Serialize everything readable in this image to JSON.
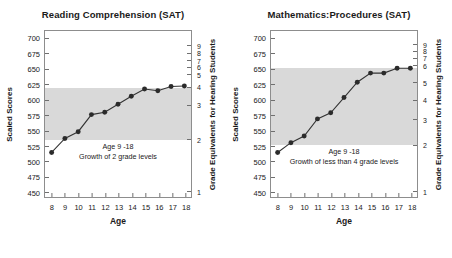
{
  "figure": {
    "width": 452,
    "height": 258,
    "background": "#ffffff",
    "band_color": "#d9d9d9",
    "line_color": "#333333",
    "marker_color": "#2b2b2b",
    "frame_color": "#8d8d8d"
  },
  "chart_data": [
    {
      "type": "line",
      "title": "Reading Comprehension (SAT)",
      "xlabel": "Age",
      "ylabel": "Scaled Scores",
      "y2label": "Grade Equivalents for Hearing Students",
      "xlim": [
        7.5,
        18.5
      ],
      "ylim": [
        440,
        712
      ],
      "xticks": [
        8,
        9,
        10,
        11,
        12,
        13,
        14,
        15,
        16,
        17,
        18
      ],
      "xticklabels": [
        "8",
        "9",
        "10",
        "11",
        "12",
        "13",
        "14",
        "15",
        "16",
        "17",
        "18"
      ],
      "yticks": [
        450,
        475,
        500,
        525,
        550,
        575,
        600,
        625,
        650,
        675,
        700
      ],
      "yticklabels": [
        "450",
        "475",
        "500",
        "525",
        "550",
        "575",
        "600",
        "625",
        "650",
        "675",
        "700"
      ],
      "y2ticks": [
        {
          "label": "1",
          "score": 452
        },
        {
          "label": "2",
          "score": 536
        },
        {
          "label": "3",
          "score": 592
        },
        {
          "label": "4",
          "score": 621
        },
        {
          "label": "5",
          "score": 641
        },
        {
          "label": "6",
          "score": 653
        },
        {
          "label": "7",
          "score": 664
        },
        {
          "label": "8",
          "score": 676
        },
        {
          "label": "9",
          "score": 688
        }
      ],
      "grid": false,
      "legend": "none",
      "shaded_band": {
        "y0": 535,
        "y1": 620,
        "label": "hearing-student-range-band"
      },
      "x": [
        8,
        9,
        10,
        11,
        12,
        13,
        14,
        15,
        16,
        17,
        18
      ],
      "values": [
        513,
        536,
        547,
        575,
        579,
        592,
        605,
        617,
        614,
        621,
        622
      ],
      "series": [
        {
          "name": "Deaf and hard-of-hearing students",
          "values": [
            513,
            536,
            547,
            575,
            579,
            592,
            605,
            617,
            614,
            621,
            622
          ]
        }
      ],
      "annotation": {
        "line1": "Age 9 -18",
        "line2": "Growth of  2 grade levels"
      }
    },
    {
      "type": "line",
      "title": "Mathematics:Procedures (SAT)",
      "xlabel": "Age",
      "ylabel": "Scaled Scores",
      "y2label": "Grade Equivalents for Hearing Students",
      "xlim": [
        7.5,
        18.5
      ],
      "ylim": [
        440,
        712
      ],
      "xticks": [
        8,
        9,
        10,
        11,
        12,
        13,
        14,
        15,
        16,
        17,
        18
      ],
      "xticklabels": [
        "8",
        "9",
        "10",
        "11",
        "12",
        "13",
        "14",
        "15",
        "16",
        "17",
        "18"
      ],
      "yticks": [
        450,
        475,
        500,
        525,
        550,
        575,
        600,
        625,
        650,
        675,
        700
      ],
      "yticklabels": [
        "450",
        "475",
        "500",
        "525",
        "550",
        "575",
        "600",
        "625",
        "650",
        "675",
        "700"
      ],
      "y2ticks": [
        {
          "label": "1",
          "score": 452
        },
        {
          "label": "2",
          "score": 527
        },
        {
          "label": "3",
          "score": 568
        },
        {
          "label": "4",
          "score": 600
        },
        {
          "label": "5",
          "score": 628
        },
        {
          "label": "6",
          "score": 656
        },
        {
          "label": "7",
          "score": 668
        },
        {
          "label": "8",
          "score": 679
        },
        {
          "label": "9",
          "score": 690
        }
      ],
      "grid": false,
      "legend": "none",
      "shaded_band": {
        "y0": 527,
        "y1": 652,
        "label": "hearing-student-range-band"
      },
      "x": [
        8,
        9,
        10,
        11,
        12,
        13,
        14,
        15,
        16,
        17,
        18
      ],
      "values": [
        513,
        529,
        540,
        568,
        578,
        603,
        628,
        643,
        643,
        651,
        651
      ],
      "series": [
        {
          "name": "Deaf and hard-of-hearing students",
          "values": [
            513,
            529,
            540,
            568,
            578,
            603,
            628,
            643,
            643,
            651,
            651
          ]
        }
      ],
      "annotation": {
        "line1": "Age 9 -18",
        "line2": "Growth of less than 4 grade levels"
      }
    }
  ]
}
